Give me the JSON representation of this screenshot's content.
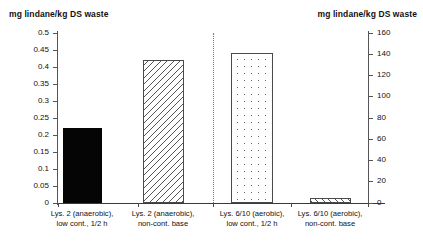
{
  "chart_data": {
    "type": "bar",
    "title": "",
    "subtitle": "",
    "categories": [
      "Lys. 2 (anaerobic), low cont., 1/2 h",
      "Lys. 2 (anaerobic), non-cont. base",
      "Lys. 6/10 (aerobic), low cont., 1/2 h",
      "Lys. 6/10 (aerobic), non-cont. base"
    ],
    "category_lines": [
      [
        "Lys. 2 (anaerobic),",
        "low cont., 1/2 h"
      ],
      [
        "Lys. 2 (anaerobic),",
        "non-cont. base"
      ],
      [
        "Lys. 6/10 (aerobic),",
        "low cont., 1/2 h"
      ],
      [
        "Lys. 6/10 (aerobic),",
        "non-cont. base"
      ]
    ],
    "values": [
      0.22,
      0.42,
      141,
      5
    ],
    "value_axis": [
      "left",
      "left",
      "right",
      "right"
    ],
    "bar_fills": [
      "solid-black",
      "hatch-backslash",
      "dots",
      "hatch-slash"
    ],
    "xlabel": "",
    "ylabel": "mg lindane/kg DS waste",
    "y2label": "mg lindane/kg DS waste",
    "ylim": [
      0,
      0.5
    ],
    "y2lim": [
      0,
      160
    ],
    "yticks": [
      0,
      0.05,
      0.1,
      0.15,
      0.2,
      0.25,
      0.3,
      0.35,
      0.4,
      0.45,
      0.5
    ],
    "ytick_labels": [
      "0",
      "0.05",
      "0.1",
      "0.15",
      "0.2",
      "0.25",
      "0.3",
      "0.35",
      "0.4",
      "0.45",
      "0.5"
    ],
    "y2ticks": [
      0,
      20,
      40,
      60,
      80,
      100,
      120,
      140,
      160
    ],
    "y2tick_labels": [
      "0",
      "20",
      "40",
      "60",
      "80",
      "100",
      "120",
      "140",
      "160"
    ],
    "grid": false,
    "legend": "none",
    "divider_after_category_index": 1,
    "colors": {
      "bar_solid": "#050505",
      "bar_outline": "#4a4a4a",
      "axis": "#555555",
      "text": "#111111",
      "background": "#ffffff"
    }
  },
  "axes": {
    "left": {
      "title": "mg lindane/kg DS waste",
      "ticks": [
        {
          "label": "0.5",
          "value": 0.5
        },
        {
          "label": "0.45",
          "value": 0.45
        },
        {
          "label": "0.4",
          "value": 0.4
        },
        {
          "label": "0.35",
          "value": 0.35
        },
        {
          "label": "0.3",
          "value": 0.3
        },
        {
          "label": "0.25",
          "value": 0.25
        },
        {
          "label": "0.2",
          "value": 0.2
        },
        {
          "label": "0.15",
          "value": 0.15
        },
        {
          "label": "0.1",
          "value": 0.1
        },
        {
          "label": "0.05",
          "value": 0.05
        },
        {
          "label": "0",
          "value": 0
        }
      ]
    },
    "right": {
      "title": "mg lindane/kg DS waste",
      "ticks": [
        {
          "label": "160",
          "value": 160
        },
        {
          "label": "140",
          "value": 140
        },
        {
          "label": "120",
          "value": 120
        },
        {
          "label": "100",
          "value": 100
        },
        {
          "label": "80",
          "value": 80
        },
        {
          "label": "60",
          "value": 60
        },
        {
          "label": "40",
          "value": 40
        },
        {
          "label": "20",
          "value": 20
        },
        {
          "label": "0",
          "value": 0
        }
      ]
    }
  },
  "bars": [
    {
      "fill": "solid-black",
      "value": 0.22,
      "axis": "left",
      "label_line1": "Lys. 2 (anaerobic),",
      "label_line2": "low cont., 1/2 h"
    },
    {
      "fill": "hatch-backslash",
      "value": 0.42,
      "axis": "left",
      "label_line1": "Lys. 2 (anaerobic),",
      "label_line2": "non-cont. base"
    },
    {
      "fill": "dots",
      "value": 141,
      "axis": "right",
      "label_line1": "Lys. 6/10 (aerobic),",
      "label_line2": "low cont., 1/2 h"
    },
    {
      "fill": "hatch-slash",
      "value": 5,
      "axis": "right",
      "label_line1": "Lys. 6/10 (aerobic),",
      "label_line2": "non-cont. base"
    }
  ]
}
